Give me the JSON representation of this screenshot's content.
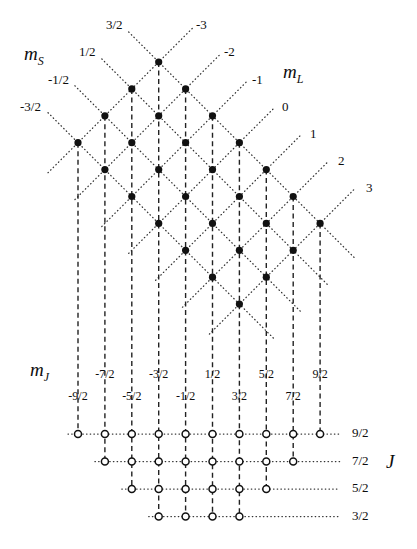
{
  "figure": {
    "kind": "angular-momentum-coupling-lattice",
    "axes": {
      "ms_title": "m",
      "ms_sub": "S",
      "ml_title": "m",
      "ml_sub": "L",
      "mj_title": "m",
      "mj_sub": "J",
      "j_title": "J"
    },
    "ms_values": [
      "-3/2",
      "-1/2",
      "1/2",
      "3/2"
    ],
    "ml_values": [
      "-3",
      "-2",
      "-1",
      "0",
      "1",
      "2",
      "3"
    ],
    "mj_upper_row": [
      "-7/2",
      "-3/2",
      "1/2",
      "5/2",
      "9/2"
    ],
    "mj_lower_row": [
      "-9/2",
      "-5/2",
      "-1/2",
      "3/2",
      "7/2"
    ],
    "mj_all": [
      "-9/2",
      "-7/2",
      "-5/2",
      "-3/2",
      "-1/2",
      "1/2",
      "3/2",
      "5/2",
      "7/2",
      "9/2"
    ],
    "j_rows": [
      {
        "label": "9/2",
        "count": 10,
        "start_col": 0
      },
      {
        "label": "7/2",
        "count": 8,
        "start_col": 1
      },
      {
        "label": "5/2",
        "count": 6,
        "start_col": 2
      },
      {
        "label": "3/2",
        "count": 4,
        "start_col": 3
      }
    ],
    "colors": {
      "ink": "#0d0d0d",
      "dot_fill": "#111111",
      "circle_stroke": "#111111",
      "dotted": "#333333",
      "dashed": "#222222",
      "background": "#ffffff"
    },
    "geometry": {
      "col_x0": 78,
      "col_dx": 26.9,
      "n_cols": 10,
      "lattice_top_y": 62,
      "lattice_dy": 26.9,
      "n_ms": 4,
      "n_ml": 7,
      "j_row_y": [
        434,
        461.5,
        489,
        516.5
      ],
      "dot_r": 3.6,
      "circle_r": 3.5
    },
    "ms_label_positions": [
      {
        "text": "3/2",
        "x": 106,
        "y": 18
      },
      {
        "text": "1/2",
        "x": 79,
        "y": 45
      },
      {
        "text": "-1/2",
        "x": 48,
        "y": 73
      },
      {
        "text": "-3/2",
        "x": 20,
        "y": 100
      }
    ],
    "ml_label_positions": [
      {
        "text": "-3",
        "x": 196,
        "y": 18
      },
      {
        "text": "-2",
        "x": 224,
        "y": 45
      },
      {
        "text": "-1",
        "x": 252,
        "y": 73
      },
      {
        "text": "0",
        "x": 282,
        "y": 100
      },
      {
        "text": "1",
        "x": 310,
        "y": 127
      },
      {
        "text": "2",
        "x": 338,
        "y": 154
      },
      {
        "text": "3",
        "x": 366,
        "y": 181
      }
    ],
    "ms_axis_label_pos": {
      "x": 24,
      "y": 44
    },
    "ml_axis_label_pos": {
      "x": 283,
      "y": 62
    },
    "mj_axis_label_pos": {
      "x": 30,
      "y": 360
    },
    "j_axis_label_pos": {
      "x": 386,
      "y": 452
    },
    "j_label_x": 352,
    "mj_upper_y": 368,
    "mj_lower_y": 390
  }
}
